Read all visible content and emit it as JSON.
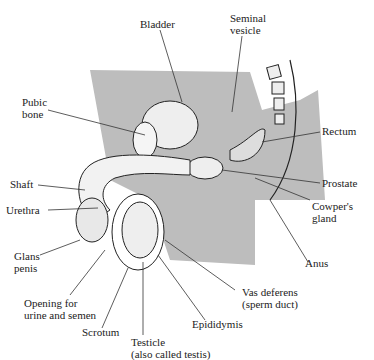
{
  "labels": {
    "bladder": "Bladder",
    "seminal_vesicle": "Seminal\nvesicle",
    "pubic_bone": "Pubic\nbone",
    "rectum": "Rectum",
    "shaft": "Shaft",
    "prostate": "Prostate",
    "urethra": "Urethra",
    "cowpers_gland": "Cowper's\ngland",
    "glans_penis": "Glans\npenis",
    "anus": "Anus",
    "vas_deferens": "Vas deferens\n(sperm duct)",
    "opening": "Opening for\nurine and semen",
    "epididymis": "Epididymis",
    "scrotum": "Scrotum",
    "testicle": "Testicle\n(also called testis)"
  }
}
